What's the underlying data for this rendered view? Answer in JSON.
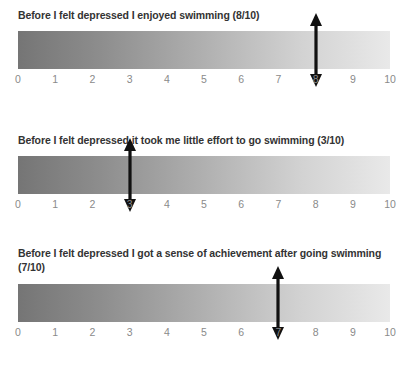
{
  "page": {
    "background_color": "#ffffff",
    "title_color": "#333333",
    "tick_color": "#8a8a8a",
    "arrow_color": "#111111",
    "gradient_start": "#757575",
    "gradient_end": "#e9e9e9"
  },
  "scales": [
    {
      "title": "Before I felt depressed I enjoyed swimming (8/10)",
      "marker_value": 8,
      "marker_label": "8",
      "ticks": [
        "0",
        "1",
        "2",
        "3",
        "4",
        "5",
        "6",
        "7",
        "8",
        "9",
        "10"
      ]
    },
    {
      "title": "Before I felt depressed it took me little effort to go swimming (3/10)",
      "marker_value": 3,
      "marker_label": "3",
      "ticks": [
        "0",
        "1",
        "2",
        "3",
        "4",
        "5",
        "6",
        "7",
        "8",
        "9",
        "10"
      ]
    },
    {
      "title": "Before I felt depressed I got a sense of achievement after going swimming (7/10)",
      "marker_value": 7,
      "marker_label": "7",
      "ticks": [
        "0",
        "1",
        "2",
        "3",
        "4",
        "5",
        "6",
        "7",
        "8",
        "9",
        "10"
      ]
    }
  ],
  "chart_data": {
    "type": "bar",
    "xlabel": "",
    "ylabel": "",
    "xlim": [
      0,
      10
    ],
    "grid": false,
    "legend": null,
    "categories": [
      "Before I felt depressed I enjoyed swimming (8/10)",
      "Before I felt depressed it took me little effort to go swimming (3/10)",
      "Before I felt depressed I got a sense of achievement after going swimming (7/10)"
    ],
    "values": [
      8,
      3,
      7
    ],
    "tick_labels": [
      "0",
      "1",
      "2",
      "3",
      "4",
      "5",
      "6",
      "7",
      "8",
      "9",
      "10"
    ],
    "annotations": [
      "Double-headed vertical arrow marker at 8 on scale 1",
      "Double-headed vertical arrow marker at 3 on scale 2",
      "Double-headed vertical arrow marker at 7 on scale 3"
    ]
  }
}
